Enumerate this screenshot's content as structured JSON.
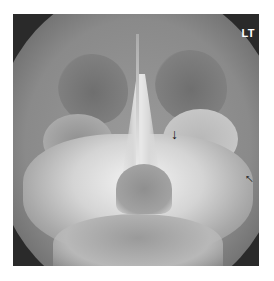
{
  "image": {
    "description": "Frontal (Waters/Caldwell view) radiograph of facial bones and paranasal sinuses",
    "orientation_label": "LT",
    "annotations": [
      {
        "type": "arrow",
        "direction": "down",
        "icon": "arrow-down-icon",
        "glyph": "↓"
      },
      {
        "type": "arrow",
        "direction": "up-left",
        "icon": "arrow-up-left-icon",
        "glyph": "↑"
      }
    ],
    "colors": {
      "background": "#ffffff",
      "film_dark": "#2a2a2a",
      "bone_bright": "#f0f0f0"
    }
  }
}
